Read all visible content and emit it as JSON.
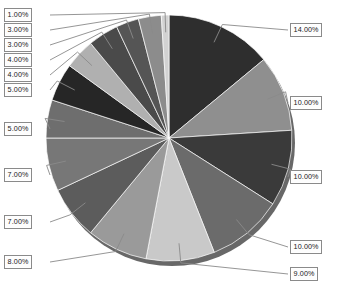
{
  "chart_data": {
    "type": "pie",
    "title": "",
    "subtitle": "",
    "xlabel": "",
    "ylabel": "",
    "legend_position": "none",
    "grid": false,
    "label_format": "percent-two-decimals",
    "start_angle_deg": 0,
    "direction": "clockwise",
    "total": 100,
    "categories": [
      "Slice 1",
      "Slice 2",
      "Slice 3",
      "Slice 4",
      "Slice 5",
      "Slice 6",
      "Slice 7",
      "Slice 8",
      "Slice 9",
      "Slice 10",
      "Slice 11",
      "Slice 12",
      "Slice 13",
      "Slice 14",
      "Slice 15"
    ],
    "values": [
      14,
      10,
      10,
      10,
      9,
      8,
      7,
      7,
      5,
      5,
      4,
      4,
      3,
      3,
      1
    ],
    "labels": [
      "14.00%",
      "10.00%",
      "10.00%",
      "10.00%",
      "9.00%",
      "8.00%",
      "7.00%",
      "7.00%",
      "5.00%",
      "5.00%",
      "4.00%",
      "4.00%",
      "3.00%",
      "3.00%",
      "1.00%"
    ],
    "colors": [
      "#2e2e2e",
      "#8f8f8f",
      "#3a3a3a",
      "#6b6b6b",
      "#c9c9c9",
      "#9a9a9a",
      "#5c5c5c",
      "#777777",
      "#6e6e6e",
      "#262626",
      "#b0b0b0",
      "#4a4a4a",
      "#555555",
      "#8c8c8c",
      "#d2d2d2"
    ],
    "slices": [
      {
        "label": "14.00%",
        "value": 14,
        "color": "#2e2e2e",
        "callout_side": "right",
        "callout_y": 23
      },
      {
        "label": "10.00%",
        "value": 10,
        "color": "#8f8f8f",
        "callout_side": "right",
        "callout_y": 96
      },
      {
        "label": "10.00%",
        "value": 10,
        "color": "#3a3a3a",
        "callout_side": "right",
        "callout_y": 170
      },
      {
        "label": "10.00%",
        "value": 10,
        "color": "#6b6b6b",
        "callout_side": "right",
        "callout_y": 240
      },
      {
        "label": "9.00%",
        "value": 9,
        "color": "#c9c9c9",
        "callout_side": "right",
        "callout_y": 267
      },
      {
        "label": "8.00%",
        "value": 8,
        "color": "#9a9a9a",
        "callout_side": "left",
        "callout_y": 255
      },
      {
        "label": "7.00%",
        "value": 7,
        "color": "#5c5c5c",
        "callout_side": "left",
        "callout_y": 215
      },
      {
        "label": "7.00%",
        "value": 7,
        "color": "#777777",
        "callout_side": "left",
        "callout_y": 168
      },
      {
        "label": "5.00%",
        "value": 5,
        "color": "#6e6e6e",
        "callout_side": "left",
        "callout_y": 122
      },
      {
        "label": "5.00%",
        "value": 5,
        "color": "#262626",
        "callout_side": "left",
        "callout_y": 83
      },
      {
        "label": "4.00%",
        "value": 4,
        "color": "#b0b0b0",
        "callout_side": "left",
        "callout_y": 68
      },
      {
        "label": "4.00%",
        "value": 4,
        "color": "#4a4a4a",
        "callout_side": "left",
        "callout_y": 53
      },
      {
        "label": "3.00%",
        "value": 3,
        "color": "#555555",
        "callout_side": "left",
        "callout_y": 38
      },
      {
        "label": "3.00%",
        "value": 3,
        "color": "#8c8c8c",
        "callout_side": "left",
        "callout_y": 23
      },
      {
        "label": "1.00%",
        "value": 1,
        "color": "#d2d2d2",
        "callout_side": "left",
        "callout_y": 8
      }
    ],
    "geometry": {
      "cx": 169,
      "cy": 138,
      "r": 123,
      "shadow_color": "#4d4d4d",
      "leader_color": "#8a8a8a",
      "background": "#ffffff"
    }
  }
}
